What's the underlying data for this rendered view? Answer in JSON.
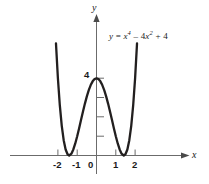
{
  "figure": {
    "equation_label": {
      "lhs": "y",
      "eq": " = ",
      "term1_base": "x",
      "term1_exp": "4",
      "op1": " – ",
      "term2_coef": "4",
      "term2_base": "x",
      "term2_exp": "2",
      "op2": " + ",
      "term3": "4",
      "plain": "y = x⁴ – 4x² + 4"
    },
    "axes": {
      "x_name": "x",
      "y_name": "y",
      "x_tick_labels": [
        "-2",
        "-1",
        "0",
        "1",
        "2"
      ],
      "y_tick_labels": [
        "4"
      ],
      "y_unlabeled_ticks": 3
    },
    "colors": {
      "curve": "#221f1f",
      "axis": "#6b6b6b",
      "text": "#1a1a1a",
      "background": "#ffffff"
    }
  },
  "chart_data": {
    "type": "line",
    "title": "",
    "subtitle": "",
    "xlabel": "x",
    "ylabel": "y",
    "annotations": [
      "y = x⁴ – 4x² + 4"
    ],
    "legend": [],
    "legend_position": "none",
    "grid": false,
    "xlim": [
      -2.45,
      2.45
    ],
    "ylim": [
      -0.55,
      6.6
    ],
    "xticks": [
      -2,
      -1,
      0,
      1,
      2
    ],
    "xtick_labels": [
      "-2",
      "-1",
      "0",
      "1",
      "2"
    ],
    "yticks": [
      1,
      2,
      3,
      4
    ],
    "ytick_labels": [
      "",
      "",
      "",
      "4"
    ],
    "series": [
      {
        "name": "y = x^4 - 4x^2 + 4",
        "expression": "x**4 - 4*x**2 + 4",
        "x": [
          -2.32,
          -2.2,
          -2.1,
          -2.0,
          -1.9,
          -1.8,
          -1.7,
          -1.6,
          -1.5,
          -1.414,
          -1.3,
          -1.2,
          -1.1,
          -1.0,
          -0.9,
          -0.8,
          -0.7,
          -0.6,
          -0.5,
          -0.4,
          -0.3,
          -0.2,
          -0.1,
          0.0,
          0.1,
          0.2,
          0.3,
          0.4,
          0.5,
          0.6,
          0.7,
          0.8,
          0.9,
          1.0,
          1.1,
          1.2,
          1.3,
          1.414,
          1.5,
          1.6,
          1.7,
          1.8,
          1.9,
          2.0,
          2.1,
          2.2,
          2.32
        ],
        "y": [
          7.47,
          4.07,
          1.81,
          4.0,
          0.58,
          1.53,
          0.79,
          0.31,
          1.06,
          0.0,
          0.09,
          0.31,
          0.62,
          1.0,
          1.42,
          1.85,
          2.28,
          2.69,
          3.06,
          3.39,
          3.65,
          3.84,
          3.96,
          4.0,
          3.96,
          3.84,
          3.65,
          3.39,
          3.06,
          2.69,
          2.28,
          1.85,
          1.42,
          1.0,
          0.62,
          0.31,
          0.09,
          0.0,
          0.06,
          0.3,
          0.79,
          1.53,
          2.58,
          4.0,
          1.81,
          4.07,
          7.47
        ]
      }
    ],
    "key_points": {
      "local_maximum": {
        "x": 0,
        "y": 4
      },
      "local_minima": [
        {
          "x": -1.414,
          "y": 0
        },
        {
          "x": 1.414,
          "y": 0
        }
      ],
      "x_intercepts": [
        -1.414,
        1.414
      ],
      "y_intercept": 4
    }
  }
}
